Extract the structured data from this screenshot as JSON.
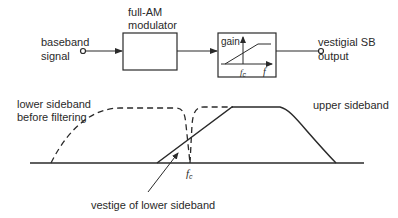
{
  "diagram": {
    "type": "block-diagram-with-spectrum",
    "blocks": {
      "input": {
        "label_line1": "baseband",
        "label_line2": "signal"
      },
      "modulator": {
        "label_line1": "full-AM",
        "label_line2": "modulator"
      },
      "filter": {
        "gain_label": "gain",
        "fc_label": "f",
        "fc_sub": "c",
        "freq_label": "f"
      },
      "output": {
        "label_line1": "vestigial SB",
        "label_line2": "output"
      }
    },
    "spectrum": {
      "lower_label_line1": "lower sideband",
      "lower_label_line2": "before filtering",
      "upper_label": "upper sideband",
      "fc_label": "f",
      "fc_sub": "c",
      "vestige_label": "vestige of lower sideband"
    },
    "colors": {
      "stroke": "#2a2a2a",
      "background": "#ffffff"
    }
  }
}
